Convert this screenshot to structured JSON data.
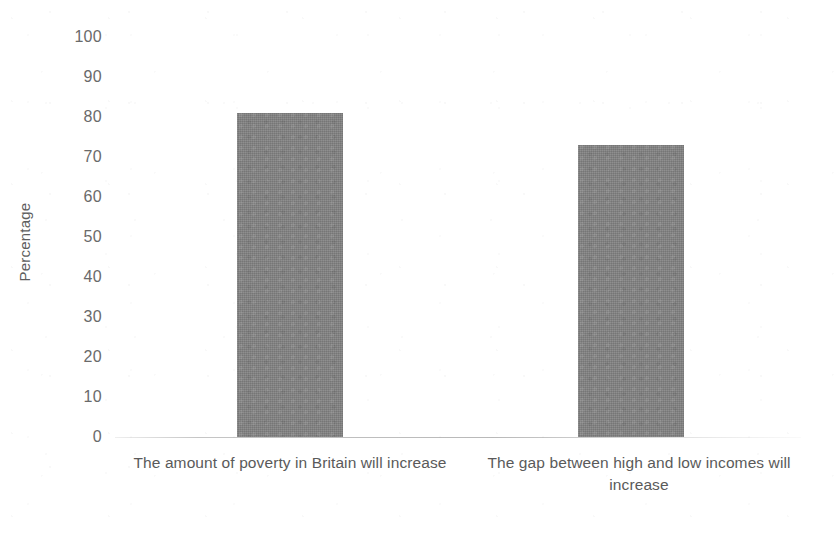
{
  "chart_data": {
    "type": "bar",
    "title": "",
    "subtitle": "",
    "xlabel": "",
    "ylabel": "Percentage",
    "categories": [
      "The amount of poverty in Britain will increase",
      "The gap between high and low incomes will increase"
    ],
    "values": [
      81,
      73
    ],
    "ylim": [
      0,
      100
    ],
    "ytick_step": 10,
    "ytick_labels": [
      "100",
      "90",
      "80",
      "70",
      "60",
      "50",
      "40",
      "30",
      "20",
      "10",
      "0"
    ],
    "ytick_values": [
      100,
      90,
      80,
      70,
      60,
      50,
      40,
      30,
      20,
      10,
      0
    ],
    "grid": false,
    "legend": false,
    "legend_position": "none",
    "bar_color": "#828282",
    "axis_line_color": "#b2b2b2",
    "text_color": "#5e5e5e",
    "background_color": "#ffffff"
  },
  "axis": {
    "y_title": "Percentage"
  }
}
